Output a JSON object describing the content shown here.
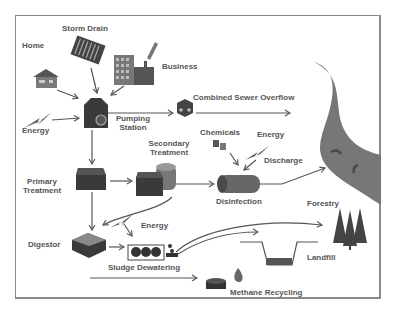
{
  "diagram": {
    "nodes": {
      "home": "Home",
      "storm_drain": "Storm Drain",
      "business": "Business",
      "energy_1": "Energy",
      "pumping_station_1": "Pumping",
      "pumping_station_2": "Station",
      "cso": "Combined Sewer Overflow",
      "secondary_1": "Secondary",
      "secondary_2": "Treatment",
      "chemicals": "Chemicals",
      "energy_2": "Energy",
      "discharge": "Discharge",
      "primary_1": "Primary",
      "primary_2": "Treatment",
      "disinfection": "Disinfection",
      "forestry": "Forestry",
      "digestor": "Digestor",
      "energy_3": "Energy",
      "sludge": "Sludge Dewatering",
      "landfill": "Landfill",
      "methane": "Methane Recycling"
    },
    "colors": {
      "dark": "#3a3a3a",
      "mid": "#6a6a6a",
      "light": "#9a9a9a",
      "river": "#7a7a7a",
      "label": "#555555",
      "frame": "#8a8a8a"
    }
  }
}
